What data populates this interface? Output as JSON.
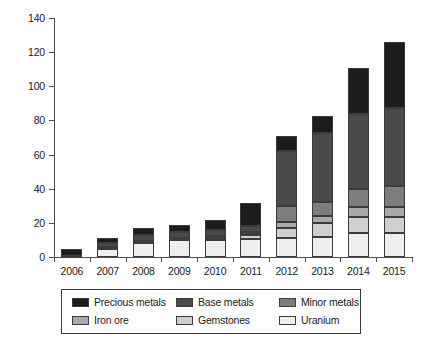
{
  "chart_data": {
    "type": "bar",
    "subtype": "stacked-bar",
    "title": "",
    "subtitle": "",
    "xlabel": "",
    "ylabel": "",
    "categories": [
      "2006",
      "2007",
      "2008",
      "2009",
      "2010",
      "2011",
      "2012",
      "2013",
      "2014",
      "2015"
    ],
    "ylim": [
      0,
      140
    ],
    "yticks": [
      0,
      20,
      40,
      60,
      80,
      100,
      120,
      140
    ],
    "ytick_labels": [
      "0",
      "20",
      "40",
      "60",
      "80",
      "100",
      "120",
      "140"
    ],
    "grid": false,
    "legend_position": "bottom",
    "stack_order_bottom_to_top": [
      "Uranium",
      "Gemstones",
      "Iron ore",
      "Minor metals",
      "Base metals",
      "Precious metals"
    ],
    "series": [
      {
        "name": "Precious metals",
        "color": "#1c1c1c",
        "values": [
          4.2,
          3.0,
          4.0,
          4.6,
          6.0,
          13.5,
          8.5,
          10.0,
          26.5,
          39.0
        ]
      },
      {
        "name": "Base metals",
        "color": "#4a4a4a",
        "values": [
          0.0,
          2.5,
          3.5,
          3.0,
          3.5,
          3.5,
          32.5,
          40.0,
          44.0,
          45.5
        ]
      },
      {
        "name": "Minor metals",
        "color": "#7d7d7d",
        "values": [
          0.0,
          0.3,
          0.6,
          0.6,
          1.0,
          1.0,
          9.5,
          8.5,
          11.0,
          12.5
        ]
      },
      {
        "name": "Iron ore",
        "color": "#a8a8a8",
        "values": [
          0.0,
          0.2,
          0.4,
          0.4,
          0.5,
          1.0,
          3.5,
          4.0,
          5.5,
          5.5
        ]
      },
      {
        "name": "Gemstones",
        "color": "#cfcfcf",
        "values": [
          0.0,
          0.2,
          0.3,
          0.3,
          0.5,
          2.5,
          5.5,
          8.0,
          9.5,
          9.5
        ]
      },
      {
        "name": "Uranium",
        "color": "#efefef",
        "values": [
          0.6,
          5.0,
          8.2,
          10.1,
          10.3,
          10.3,
          11.3,
          12.0,
          14.0,
          14.0
        ]
      }
    ],
    "totals": [
      4.8,
      11.2,
      17.0,
      19.0,
      21.8,
      31.8,
      70.8,
      82.5,
      110.5,
      126.0
    ]
  },
  "legend": {
    "items": [
      {
        "label": "Precious metals",
        "color": "#1c1c1c"
      },
      {
        "label": "Base metals",
        "color": "#4a4a4a"
      },
      {
        "label": "Minor metals",
        "color": "#7d7d7d"
      },
      {
        "label": "Iron ore",
        "color": "#a8a8a8"
      },
      {
        "label": "Gemstones",
        "color": "#cfcfcf"
      },
      {
        "label": "Uranium",
        "color": "#efefef"
      }
    ]
  }
}
